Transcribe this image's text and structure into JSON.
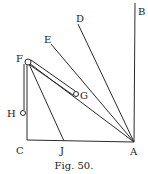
{
  "figure": {
    "caption": "Fig. 50.",
    "labels": {
      "A": "A",
      "B": "B",
      "C": "C",
      "D": "D",
      "E": "E",
      "F": "F",
      "G": "G",
      "H": "H",
      "J": "J"
    },
    "segments": [
      {
        "name": "line-ab",
        "from": "A",
        "to": "B"
      },
      {
        "name": "line-ad",
        "from": "A",
        "to": "D"
      },
      {
        "name": "line-ae",
        "from": "A",
        "to": "E"
      },
      {
        "name": "line-af",
        "from": "A",
        "to": "F"
      },
      {
        "name": "line-ca",
        "from": "C",
        "to": "A"
      },
      {
        "name": "line-fc",
        "from": "F",
        "to": "C"
      },
      {
        "name": "line-fj",
        "from": "F",
        "to": "J"
      },
      {
        "name": "line-fh",
        "from": "F",
        "to": "H"
      },
      {
        "name": "rod-fg",
        "from": "F",
        "to": "G"
      }
    ],
    "points": [
      "F",
      "G",
      "H"
    ],
    "line_color": "#2a2a2a"
  }
}
